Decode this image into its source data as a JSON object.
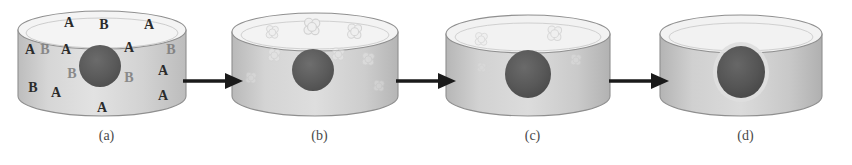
{
  "figure": {
    "title": "",
    "panel_count": 4,
    "background_color": "#ffffff"
  },
  "colors": {
    "cylinder_body_light": "#e3e3e3",
    "cylinder_body_mid": "#c9c9c9",
    "cylinder_body_dark": "#b0b0b0",
    "cylinder_top_fill": "#f2f2f2",
    "cylinder_outline": "#8c8c8c",
    "sphere_dark": "#595959",
    "sphere_darker": "#4a4a4a",
    "halo_light": "#dcdcdc",
    "letter_color": "#2b2b2b",
    "letter_color_faint": "#6f6f6f",
    "cluster_color": "#cfcfcf",
    "arrow_color": "#1a1a1a",
    "caption_color": "#4a4a4a"
  },
  "panels": [
    {
      "id": "a",
      "caption": "(a)",
      "sphere": {
        "cx": 84,
        "cy": 58,
        "rx": 21,
        "ry": 21,
        "halo": false
      },
      "markers_type": "letters",
      "letters": [
        {
          "char": "A",
          "x": 53,
          "y": 15,
          "faint": false
        },
        {
          "char": "B",
          "x": 88,
          "y": 17,
          "faint": false
        },
        {
          "char": "A",
          "x": 133,
          "y": 17,
          "faint": false
        },
        {
          "char": "A",
          "x": 14,
          "y": 42,
          "faint": false
        },
        {
          "char": "B",
          "x": 29,
          "y": 42,
          "faint": true
        },
        {
          "char": "A",
          "x": 50,
          "y": 42,
          "faint": false
        },
        {
          "char": "A",
          "x": 113,
          "y": 40,
          "faint": false
        },
        {
          "char": "B",
          "x": 155,
          "y": 42,
          "faint": true
        },
        {
          "char": "A",
          "x": 147,
          "y": 63,
          "faint": false
        },
        {
          "char": "B",
          "x": 56,
          "y": 66,
          "faint": true
        },
        {
          "char": "B",
          "x": 113,
          "y": 70,
          "faint": true
        },
        {
          "char": "B",
          "x": 17,
          "y": 80,
          "faint": false
        },
        {
          "char": "A",
          "x": 40,
          "y": 85,
          "faint": false
        },
        {
          "char": "A",
          "x": 147,
          "y": 88,
          "faint": false
        },
        {
          "char": "A",
          "x": 86,
          "y": 100,
          "faint": false
        }
      ],
      "clusters": []
    },
    {
      "id": "b",
      "caption": "(b)",
      "sphere": {
        "cx": 84,
        "cy": 62,
        "rx": 21,
        "ry": 21,
        "halo": false
      },
      "markers_type": "clusters",
      "letters": [],
      "clusters": [
        {
          "x": 44,
          "y": 25,
          "r": 7,
          "opacity": 0.85
        },
        {
          "x": 84,
          "y": 20,
          "r": 9,
          "opacity": 0.9
        },
        {
          "x": 126,
          "y": 24,
          "r": 8,
          "opacity": 0.85
        },
        {
          "x": 46,
          "y": 48,
          "r": 7,
          "opacity": 0.45
        },
        {
          "x": 110,
          "y": 47,
          "r": 7,
          "opacity": 0.45
        },
        {
          "x": 140,
          "y": 52,
          "r": 7,
          "opacity": 0.4
        },
        {
          "x": 22,
          "y": 70,
          "r": 6,
          "opacity": 0.3
        },
        {
          "x": 150,
          "y": 78,
          "r": 6,
          "opacity": 0.3
        }
      ]
    },
    {
      "id": "c",
      "caption": "(c)",
      "sphere": {
        "cx": 86,
        "cy": 66,
        "rx": 23,
        "ry": 24,
        "halo": false
      },
      "markers_type": "clusters",
      "letters": [],
      "clusters": [
        {
          "x": 40,
          "y": 32,
          "r": 7,
          "opacity": 0.7
        },
        {
          "x": 113,
          "y": 26,
          "r": 8,
          "opacity": 0.75
        },
        {
          "x": 134,
          "y": 52,
          "r": 6,
          "opacity": 0.3
        },
        {
          "x": 40,
          "y": 60,
          "r": 5,
          "opacity": 0.18
        }
      ]
    },
    {
      "id": "d",
      "caption": "(d)",
      "sphere": {
        "cx": 86,
        "cy": 64,
        "rx": 24,
        "ry": 26,
        "halo": true
      },
      "markers_type": "none",
      "letters": [],
      "clusters": []
    }
  ],
  "arrows": [
    {
      "id": "arrow-a-to-b",
      "direction": "right"
    },
    {
      "id": "arrow-b-to-c",
      "direction": "right"
    },
    {
      "id": "arrow-c-to-d",
      "direction": "right"
    }
  ]
}
